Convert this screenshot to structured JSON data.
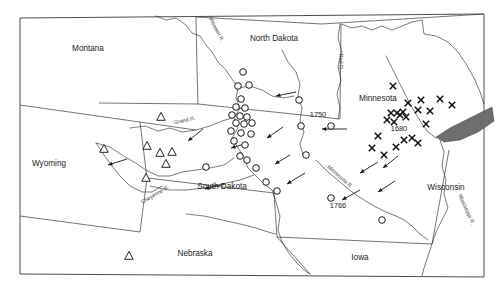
{
  "figure": {
    "background_color": "#ffffff",
    "frame_color": "#3a3a3a",
    "width": 502,
    "height": 288
  },
  "states": [
    {
      "name": "Montana",
      "x": 88,
      "y": 51
    },
    {
      "name": "North Dakota",
      "x": 274,
      "y": 41
    },
    {
      "name": "Minnesota",
      "x": 378,
      "y": 101
    },
    {
      "name": "Wyoming",
      "x": 49,
      "y": 166
    },
    {
      "name": "South Dakota",
      "x": 222,
      "y": 189
    },
    {
      "name": "Wisconsin",
      "x": 446,
      "y": 190
    },
    {
      "name": "Nebraska",
      "x": 195,
      "y": 256
    },
    {
      "name": "Iowa",
      "x": 360,
      "y": 260
    }
  ],
  "rivers": [
    {
      "name": "Missouri R.",
      "x": 215,
      "y": 30,
      "rotate": 62
    },
    {
      "name": "Grand R.",
      "x": 185,
      "y": 122,
      "rotate": -12
    },
    {
      "name": "Cheyenne R.",
      "x": 156,
      "y": 196,
      "rotate": -30
    },
    {
      "name": "Red R.",
      "x": 339,
      "y": 62,
      "rotate": 90
    },
    {
      "name": "Minnesota R.",
      "x": 339,
      "y": 178,
      "rotate": 41
    },
    {
      "name": "Mississippi R.",
      "x": 465,
      "y": 210,
      "rotate": 66
    }
  ],
  "date_labels": [
    {
      "value": "1750",
      "x": 318,
      "y": 117
    },
    {
      "value": "1680",
      "x": 399,
      "y": 131
    },
    {
      "value": "1766",
      "x": 338,
      "y": 208
    }
  ],
  "legend_semantics": {
    "circle": "open-circle-site-marker",
    "triangle": "open-triangle-site-marker",
    "cross": "x-cross-site-marker",
    "arrow": "migration-direction-arrow",
    "lake": "lake-pepin-water-body"
  },
  "markers": {
    "circles": [
      {
        "x": 243,
        "y": 72
      },
      {
        "x": 238,
        "y": 86
      },
      {
        "x": 249,
        "y": 85
      },
      {
        "x": 241,
        "y": 99
      },
      {
        "x": 236,
        "y": 107
      },
      {
        "x": 245,
        "y": 108
      },
      {
        "x": 232,
        "y": 115
      },
      {
        "x": 240,
        "y": 116
      },
      {
        "x": 247,
        "y": 117
      },
      {
        "x": 236,
        "y": 123
      },
      {
        "x": 244,
        "y": 124
      },
      {
        "x": 252,
        "y": 123
      },
      {
        "x": 231,
        "y": 131
      },
      {
        "x": 241,
        "y": 133
      },
      {
        "x": 251,
        "y": 134
      },
      {
        "x": 234,
        "y": 141
      },
      {
        "x": 245,
        "y": 145
      },
      {
        "x": 240,
        "y": 156
      },
      {
        "x": 247,
        "y": 160
      },
      {
        "x": 256,
        "y": 168
      },
      {
        "x": 266,
        "y": 182
      },
      {
        "x": 277,
        "y": 191
      },
      {
        "x": 206,
        "y": 167
      },
      {
        "x": 299,
        "y": 100
      },
      {
        "x": 301,
        "y": 126
      },
      {
        "x": 331,
        "y": 126
      },
      {
        "x": 306,
        "y": 155
      },
      {
        "x": 331,
        "y": 198
      },
      {
        "x": 382,
        "y": 220
      }
    ],
    "triangles": [
      {
        "x": 161,
        "y": 117
      },
      {
        "x": 147,
        "y": 146
      },
      {
        "x": 160,
        "y": 153
      },
      {
        "x": 172,
        "y": 152
      },
      {
        "x": 166,
        "y": 164
      },
      {
        "x": 104,
        "y": 149
      },
      {
        "x": 146,
        "y": 178
      },
      {
        "x": 129,
        "y": 256
      }
    ],
    "crosses": [
      {
        "x": 393,
        "y": 86
      },
      {
        "x": 408,
        "y": 103
      },
      {
        "x": 421,
        "y": 100
      },
      {
        "x": 418,
        "y": 110
      },
      {
        "x": 430,
        "y": 111
      },
      {
        "x": 403,
        "y": 112
      },
      {
        "x": 397,
        "y": 113
      },
      {
        "x": 391,
        "y": 113
      },
      {
        "x": 400,
        "y": 115
      },
      {
        "x": 406,
        "y": 117
      },
      {
        "x": 387,
        "y": 120
      },
      {
        "x": 394,
        "y": 122
      },
      {
        "x": 426,
        "y": 124
      },
      {
        "x": 440,
        "y": 99
      },
      {
        "x": 452,
        "y": 105
      },
      {
        "x": 378,
        "y": 136
      },
      {
        "x": 404,
        "y": 140
      },
      {
        "x": 412,
        "y": 138
      },
      {
        "x": 418,
        "y": 143
      },
      {
        "x": 396,
        "y": 147
      },
      {
        "x": 384,
        "y": 155
      },
      {
        "x": 372,
        "y": 148
      }
    ],
    "arrows": [
      {
        "x1": 296,
        "y1": 92,
        "x2": 276,
        "y2": 96
      },
      {
        "x1": 347,
        "y1": 129,
        "x2": 322,
        "y2": 129
      },
      {
        "x1": 283,
        "y1": 127,
        "x2": 267,
        "y2": 138
      },
      {
        "x1": 248,
        "y1": 143,
        "x2": 231,
        "y2": 148
      },
      {
        "x1": 225,
        "y1": 184,
        "x2": 205,
        "y2": 189
      },
      {
        "x1": 127,
        "y1": 159,
        "x2": 108,
        "y2": 165
      },
      {
        "x1": 203,
        "y1": 129,
        "x2": 188,
        "y2": 141
      },
      {
        "x1": 290,
        "y1": 155,
        "x2": 275,
        "y2": 164
      },
      {
        "x1": 378,
        "y1": 162,
        "x2": 360,
        "y2": 173
      },
      {
        "x1": 360,
        "y1": 190,
        "x2": 342,
        "y2": 200
      },
      {
        "x1": 395,
        "y1": 181,
        "x2": 378,
        "y2": 192
      },
      {
        "x1": 398,
        "y1": 156,
        "x2": 383,
        "y2": 168
      },
      {
        "x1": 305,
        "y1": 173,
        "x2": 287,
        "y2": 184
      }
    ]
  }
}
